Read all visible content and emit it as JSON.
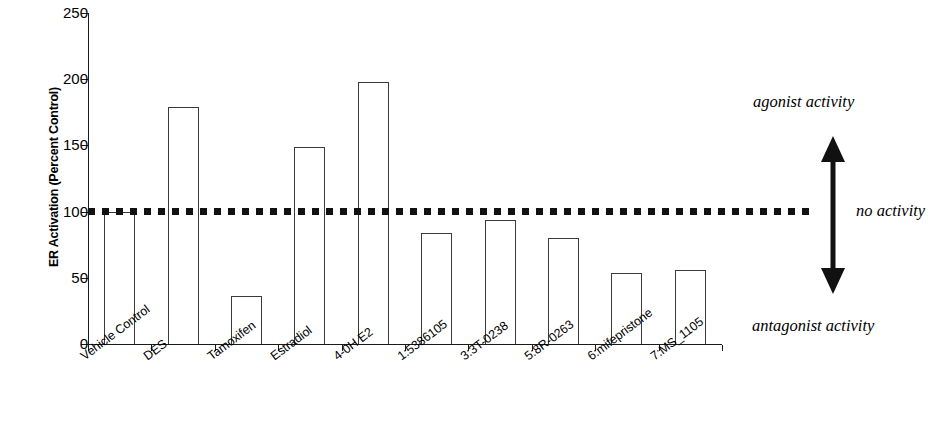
{
  "chart_data": {
    "type": "bar",
    "title": "",
    "xlabel": "",
    "ylabel": "ER Activation (Percent Control)",
    "ylim": [
      0,
      250
    ],
    "ytick_values": [
      250,
      200,
      150,
      100,
      50,
      0
    ],
    "ytick_labels": [
      "250",
      "200",
      "150",
      "100",
      "50",
      "0"
    ],
    "grid": false,
    "legend": "none",
    "categories": [
      "Vehicle Control",
      "DES",
      "Tamoxifen",
      "Estradiol",
      "4-0H E2",
      "1:5386105",
      "3:3T-0238",
      "5:8R-0263",
      "6:mifepristone",
      "7:MS_1105"
    ],
    "values": [
      100,
      179,
      36,
      149,
      198,
      84,
      94,
      80,
      54,
      56
    ],
    "reference_line": {
      "value": 100,
      "style": "dotted",
      "label": "no activity"
    },
    "annotations": [
      {
        "text": "agonist activity",
        "position": "upper-right"
      },
      {
        "text": "no activity",
        "position": "middle-right"
      },
      {
        "text": "antagonist activity",
        "position": "lower-right"
      }
    ],
    "arrow": {
      "name": "double-headed-vertical-arrow",
      "direction": "up-down",
      "meaning_up": "agonist activity",
      "meaning_down": "antagonist activity"
    },
    "colors": {
      "bar_fill": "#ffffff",
      "bar_edge": "#3a3a3a",
      "axis": "#1a1a1a",
      "reference_line": "#111111",
      "text": "#000000"
    }
  }
}
